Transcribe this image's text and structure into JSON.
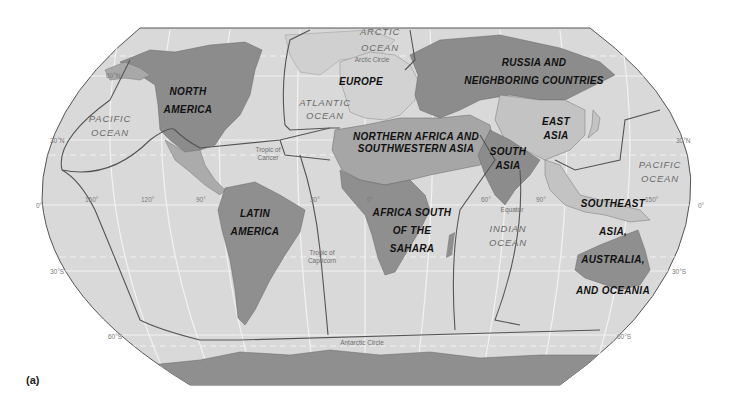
{
  "figure": {
    "label": "(a)"
  },
  "colors": {
    "ocean": "#d9d9d9",
    "land_light": "#cfcfcf",
    "land_medium": "#ababab",
    "land_dark": "#8f8f8f",
    "border": "#555555",
    "graticule": "#f4f4f4"
  },
  "regions": [
    {
      "id": "north-america",
      "lines": [
        "NORTH",
        "AMERICA"
      ]
    },
    {
      "id": "europe",
      "lines": [
        "EUROPE"
      ]
    },
    {
      "id": "russia",
      "lines": [
        "RUSSIA AND",
        "NEIGHBORING COUNTRIES"
      ]
    },
    {
      "id": "east-asia",
      "lines": [
        "EAST",
        "ASIA"
      ]
    },
    {
      "id": "nafrica-swasia",
      "lines": [
        "NORTHERN AFRICA AND",
        "SOUTHWESTERN ASIA"
      ]
    },
    {
      "id": "south-asia",
      "lines": [
        "SOUTH",
        "ASIA"
      ]
    },
    {
      "id": "latin-america",
      "lines": [
        "LATIN",
        "AMERICA"
      ]
    },
    {
      "id": "subsaharan-africa",
      "lines": [
        "AFRICA SOUTH",
        "OF THE",
        "SAHARA"
      ]
    },
    {
      "id": "seasia-oceania",
      "lines": [
        "SOUTHEAST",
        "ASIA,",
        "AUSTRALIA,",
        "AND OCEANIA"
      ]
    }
  ],
  "oceans": [
    {
      "id": "arctic",
      "lines": [
        "ARCTIC",
        "OCEAN"
      ]
    },
    {
      "id": "atlantic",
      "lines": [
        "ATLANTIC",
        "OCEAN"
      ]
    },
    {
      "id": "pacific-west",
      "lines": [
        "PACIFIC",
        "OCEAN"
      ]
    },
    {
      "id": "pacific-east",
      "lines": [
        "PACIFIC",
        "OCEAN"
      ]
    },
    {
      "id": "indian",
      "lines": [
        "INDIAN",
        "OCEAN"
      ]
    }
  ],
  "reference_lines": {
    "arctic_circle": "Arctic Circle",
    "tropic_cancer": [
      "Tropic of",
      "Cancer"
    ],
    "equator": "Equator",
    "tropic_capricorn": [
      "Tropic of",
      "Capricorn"
    ],
    "antarctic_circle": "Antarctic Circle"
  },
  "coordinates": {
    "lat_60n": "60°N",
    "lat_30n_w": "30°N",
    "lat_30n_e": "30°N",
    "lat_0_w": "0°",
    "lat_0_e": "0°",
    "lat_30s_w": "30°S",
    "lat_30s_e": "30°S",
    "lat_60s_w": "60°S",
    "lat_60s_e": "60°S",
    "lon_150w": "150°",
    "lon_120w": "120°",
    "lon_90w": "90°",
    "lon_30w": "30°",
    "lon_0": "0°",
    "lon_60e": "60°",
    "lon_90e": "90°",
    "lon_150e": "150°"
  }
}
